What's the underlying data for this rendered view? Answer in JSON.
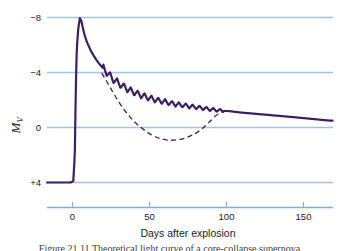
{
  "figure": {
    "caption": "Figure 21.11  Theoretical light curve of a core-collapse supernova"
  },
  "colors": {
    "curve": "#3b1f5e",
    "gridline": "#9fc4e8",
    "axis": "#7fb0dd",
    "text": "#1a1a1a",
    "background": "#ffffff"
  },
  "axes": {
    "y_title_main": "M",
    "y_title_sub": "V",
    "y_ticks": [
      "−8",
      "−4",
      "0",
      "+4"
    ],
    "x_title": "Days after explosion",
    "x_ticks": [
      "0",
      "50",
      "100",
      "150"
    ]
  },
  "chart_data": {
    "type": "line",
    "title": "",
    "subtitle": "",
    "xlabel": "Days after explosion",
    "ylabel": "M_V",
    "xlim": [
      -18,
      165
    ],
    "ylim": [
      4.8,
      -8.6
    ],
    "y_inverted": true,
    "grid": true,
    "gridlines_y": [
      -8,
      -4,
      0,
      4
    ],
    "xticks": [
      0,
      50,
      100,
      150
    ],
    "yticks": [
      -8,
      -4,
      0,
      4
    ],
    "ytick_labels": [
      "−8",
      "−4",
      "0",
      "+4"
    ],
    "legend": "none",
    "series": [
      {
        "name": "observed light curve (with radioactive-decay oscillations)",
        "style": "solid",
        "color": "#3b1f5e",
        "linewidth": 2.2,
        "x": [
          -18,
          -3,
          -1.2,
          -0.2,
          0.3,
          1.0,
          2.0,
          3.0,
          4.0,
          5.0,
          6.0,
          7.0,
          8.0,
          10.0,
          12.0,
          14.0,
          16.0,
          18.0,
          20.0,
          24.0,
          28.0,
          32.0,
          36.0,
          40.0,
          46.0,
          52.0,
          58.0,
          64.0,
          70.0,
          76.0,
          82.0,
          88.0,
          92.0,
          95.0,
          98.0,
          105.0,
          120.0,
          140.0,
          163.0
        ],
        "y": [
          4.0,
          4.0,
          3.9,
          2.0,
          -2.0,
          -5.6,
          -7.2,
          -7.95,
          -7.75,
          -7.2,
          -6.75,
          -6.4,
          -6.1,
          -5.6,
          -5.2,
          -4.85,
          -4.55,
          -4.3,
          -4.05,
          -3.55,
          -3.2,
          -2.9,
          -2.65,
          -2.45,
          -2.2,
          -2.0,
          -1.85,
          -1.7,
          -1.6,
          -1.5,
          -1.4,
          -1.3,
          -1.25,
          -1.2,
          -1.2,
          -1.1,
          -0.95,
          -0.75,
          -0.5
        ]
      },
      {
        "name": "oscillation envelope amplitude (magnitudes, peak-to-peak)",
        "style": "oscillation-parameters",
        "start_day": 18,
        "end_day": 95,
        "period_days": 4.4,
        "amplitude_start": 0.58,
        "amplitude_end": 0.22
      },
      {
        "name": "smooth model without oscillations",
        "style": "dashed",
        "color": "#3b1f5e",
        "linewidth": 1.3,
        "x": [
          17.0,
          20.0,
          24.0,
          28.0,
          32.0,
          36.0,
          40.0,
          45.0,
          50.0,
          55.0,
          60.0,
          65.0,
          70.0,
          75.0,
          80.0,
          85.0,
          90.0,
          94.0,
          97.0
        ],
        "y": [
          -3.95,
          -3.4,
          -2.6,
          -1.85,
          -1.2,
          -0.65,
          -0.2,
          0.25,
          0.6,
          0.82,
          0.92,
          0.9,
          0.78,
          0.55,
          0.2,
          -0.3,
          -0.85,
          -1.15,
          -1.22
        ]
      }
    ]
  }
}
